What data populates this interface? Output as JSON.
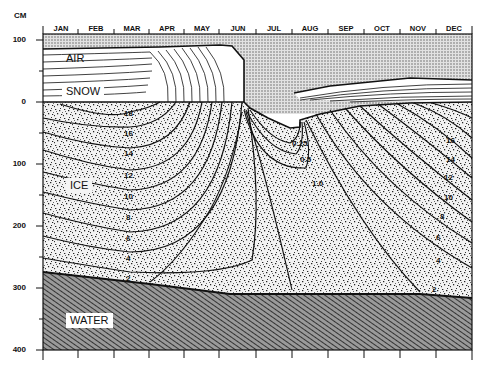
{
  "diagram": {
    "y_axis": {
      "unit": "CM",
      "ticks": [
        "100",
        "0",
        "100",
        "200",
        "300",
        "400"
      ]
    },
    "x_axis": {
      "months": [
        "JAN",
        "FEB",
        "MAR",
        "APR",
        "MAY",
        "JUN",
        "JUL",
        "AUG",
        "SEP",
        "OCT",
        "NOV",
        "DEC"
      ]
    },
    "regions": {
      "air": "AIR",
      "snow": "SNOW",
      "ice": "ICE",
      "water": "WATER"
    },
    "isotherm_labels": {
      "left": [
        "18",
        "16",
        "14",
        "12",
        "10",
        "8",
        "6",
        "4",
        "2"
      ],
      "summer": [
        "0.25",
        "0.5",
        "1.0"
      ],
      "right": [
        "16",
        "14",
        "12",
        "10",
        "8",
        "6",
        "4",
        "2"
      ]
    },
    "colors": {
      "ink": "#111111",
      "air_fill": "#bdbdbd",
      "ice_fill": "#d6d6d6",
      "water_fill": "#6a6a6a",
      "background": "#ffffff"
    }
  }
}
